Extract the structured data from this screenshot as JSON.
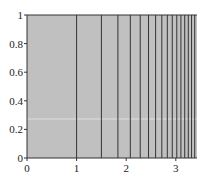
{
  "chart_data": {
    "type": "line",
    "title": "",
    "xlabel": "",
    "ylabel": "",
    "xlim": [
      0,
      3.43
    ],
    "ylim": [
      0,
      1
    ],
    "x_ticks": [
      "0",
      "1",
      "2",
      "3"
    ],
    "y_ticks": [
      "0",
      "0.2",
      "0.4",
      "0.6",
      "0.8",
      "1"
    ],
    "grid": false,
    "background_color": "#c0c0c0",
    "line_color": "#333333",
    "vertical_lines_x": [
      1.0,
      1.5,
      1.833,
      2.083,
      2.283,
      2.45,
      2.593,
      2.718,
      2.829,
      2.929,
      3.02,
      3.103,
      3.18,
      3.252,
      3.318,
      3.381
    ],
    "annotations": []
  }
}
